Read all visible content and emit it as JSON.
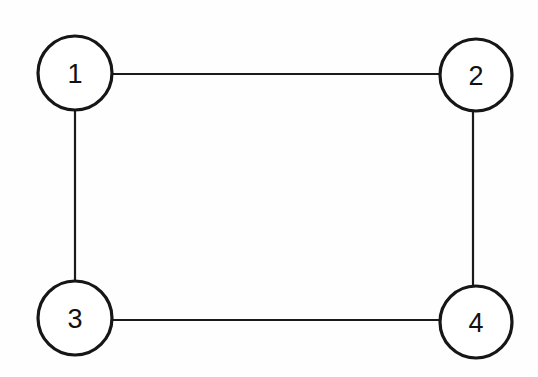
{
  "diagram": {
    "type": "undirected-graph",
    "title": "",
    "background_color": "#fefefe",
    "stroke_color": "#161616",
    "edge_color": "#1a1a1a",
    "node_fill_color": "#ffffff",
    "node_label_color": "#111111",
    "width": 538,
    "height": 377,
    "nodes": [
      {
        "id": "1",
        "label": "1",
        "cx": 75,
        "cy": 73,
        "r": 37
      },
      {
        "id": "2",
        "label": "2",
        "cx": 476,
        "cy": 75,
        "r": 36
      },
      {
        "id": "3",
        "label": "3",
        "cx": 75,
        "cy": 318,
        "r": 37
      },
      {
        "id": "4",
        "label": "4",
        "cx": 476,
        "cy": 322,
        "r": 36
      }
    ],
    "edges": [
      {
        "id": "edge-1-2",
        "source": "1",
        "target": "2",
        "x1": 112,
        "y1": 74,
        "x2": 440,
        "y2": 74
      },
      {
        "id": "edge-1-3",
        "source": "1",
        "target": "3",
        "x1": 75,
        "y1": 110,
        "x2": 75,
        "y2": 282
      },
      {
        "id": "edge-2-4",
        "source": "2",
        "target": "4",
        "x1": 473,
        "y1": 111,
        "x2": 473,
        "y2": 287
      },
      {
        "id": "edge-3-4",
        "source": "3",
        "target": "4",
        "x1": 112,
        "y1": 320,
        "x2": 440,
        "y2": 320
      }
    ]
  }
}
